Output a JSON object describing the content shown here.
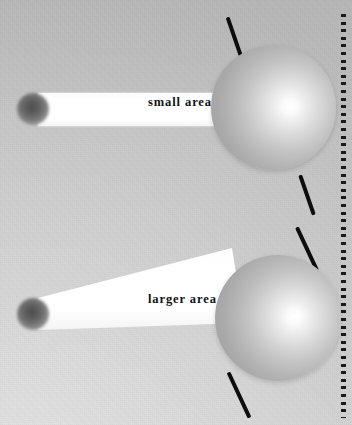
{
  "figure": {
    "background_color": "#cccccc",
    "width": 352,
    "height": 425
  },
  "scenes": [
    {
      "id": "small-area",
      "label": "small  area",
      "beam_type": "parallel-rectangle",
      "beam_description": "narrow horizontal beam of constant width striking the sphere head-on",
      "source_name": "light-source",
      "planet_name": "sphere",
      "axis_tilt_description": "axis tilted so the illuminated beam meets a small surface area",
      "axis_color": "#0d0d0d",
      "beam_color": "#ffffff",
      "planet_highlight_color": "#ffffff",
      "planet_shadow_color": "#9a9a9a"
    },
    {
      "id": "larger-area",
      "label": "larger  area",
      "beam_type": "spreading-wedge",
      "beam_description": "beam that widens toward the sphere, spreading energy over a larger surface area",
      "source_name": "light-source",
      "planet_name": "sphere",
      "axis_tilt_description": "axis tilted more steeply so the same beam spreads over a larger area",
      "axis_color": "#0d0d0d",
      "beam_color": "#ffffff",
      "planet_highlight_color": "#ffffff",
      "planet_shadow_color": "#9a9a9a"
    }
  ],
  "decorations": {
    "dotted_border_name": "dotted-vertical-rule",
    "dotted_border_color": "#1a1a1a"
  },
  "icons": {
    "source_icon": "star-burst-icon",
    "planet_icon": "sphere-icon",
    "axis_icon": "rotation-axis-icon",
    "beam_icon": "light-beam-icon"
  }
}
